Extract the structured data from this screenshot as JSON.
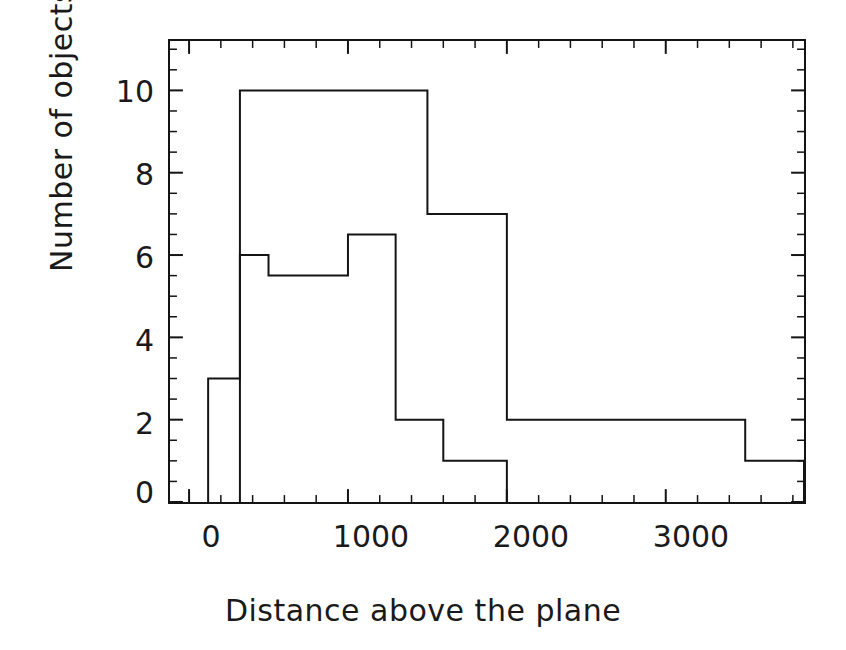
{
  "chart_data": {
    "type": "line",
    "subtype": "step-histogram",
    "title": "",
    "xlabel": "Distance above the plane",
    "ylabel": "Number of objects",
    "xlim": [
      -120,
      3870
    ],
    "ylim": [
      0,
      11.2
    ],
    "grid": false,
    "legend": false,
    "xticks": [
      0,
      1000,
      2000,
      3000
    ],
    "xtick_labels": [
      "0",
      "1000",
      "2000",
      "3000"
    ],
    "xticks_minor_step": 200,
    "yticks": [
      0,
      2,
      4,
      6,
      8,
      10
    ],
    "ytick_labels": [
      "0",
      "2",
      "4",
      "6",
      "8",
      "10"
    ],
    "yticks_minor_step": 0.5,
    "line_color": "#141414",
    "line_width": 2,
    "series": [
      {
        "name": "histogram-tall",
        "bin_edges": [
          320,
          500,
          1500,
          2000,
          3500
        ],
        "values": [
          10,
          10,
          7,
          2
        ]
      },
      {
        "name": "histogram-low",
        "bin_edges": [
          120,
          320,
          500,
          700,
          1180,
          1500,
          1700,
          2000
        ],
        "values": [
          3,
          6,
          5.5,
          5.5,
          6.5,
          2,
          1
        ]
      }
    ],
    "step_points_tall": [
      [
        320,
        0
      ],
      [
        320,
        10
      ],
      [
        1500,
        10
      ],
      [
        1500,
        7
      ],
      [
        2000,
        7
      ],
      [
        2000,
        2
      ],
      [
        3500,
        2
      ],
      [
        3500,
        1
      ],
      [
        3870,
        1
      ],
      [
        3870,
        0
      ]
    ],
    "step_points_low": [
      [
        120,
        0
      ],
      [
        120,
        3
      ],
      [
        320,
        3
      ],
      [
        320,
        6
      ],
      [
        500,
        6
      ],
      [
        500,
        5.5
      ],
      [
        1000,
        5.5
      ],
      [
        1000,
        6.5
      ],
      [
        1300,
        6.5
      ],
      [
        1300,
        2
      ],
      [
        1600,
        2
      ],
      [
        1600,
        1
      ],
      [
        2000,
        1
      ],
      [
        2000,
        0
      ]
    ]
  },
  "axis": {
    "y_title": "Number of objects",
    "x_title": "Distance above the plane",
    "y_tick_labels": [
      "10",
      "8",
      "6",
      "4",
      "2",
      "0"
    ],
    "x_tick_labels": [
      "0",
      "1000",
      "2000",
      "3000"
    ]
  },
  "colors": {
    "ink": "#141414",
    "background": "#ffffff"
  }
}
